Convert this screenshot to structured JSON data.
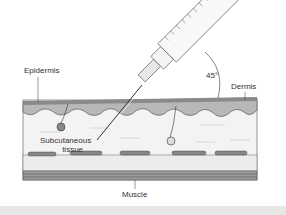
{
  "figure": {
    "labels": {
      "epidermis": "Epidermis",
      "dermis": "Dermis",
      "angle": "45°",
      "subcutaneous_line1": "Subcutaneous",
      "subcutaneous_line2": "tissue",
      "muscle": "Muscle"
    },
    "colors": {
      "epidermis": "#8f8f8f",
      "dermis": "#b5b5b5",
      "subcutaneous": "#f2f2f2",
      "fat": "#e8e8e8",
      "muscle": "#9a9a9a",
      "line": "#333333"
    }
  }
}
